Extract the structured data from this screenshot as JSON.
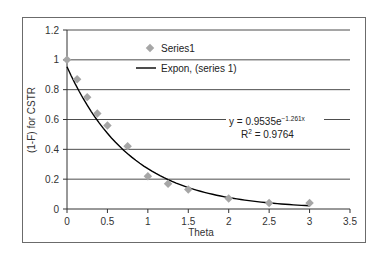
{
  "chart_data": {
    "type": "scatter",
    "title": "",
    "xlabel": "Theta",
    "ylabel": "(1-F) for CSTR",
    "xlim": [
      0,
      3.5
    ],
    "ylim": [
      0,
      1.2
    ],
    "x_ticks": [
      "0",
      "0.5",
      "1",
      "1.5",
      "2",
      "2.5",
      "3",
      "3.5"
    ],
    "y_ticks": [
      "0",
      "0.2",
      "0.4",
      "0.6",
      "0.8",
      "1",
      "1.2"
    ],
    "grid": {
      "horizontal": true,
      "vertical": false
    },
    "legend_position": "upper-center-inside",
    "series": [
      {
        "name": "Series1",
        "kind": "markers",
        "marker": "diamond",
        "color": "#a6a6a6",
        "x": [
          0,
          0.125,
          0.25,
          0.375,
          0.5,
          0.75,
          1.0,
          1.25,
          1.5,
          2.0,
          2.5,
          3.0
        ],
        "y": [
          1.0,
          0.87,
          0.75,
          0.64,
          0.56,
          0.42,
          0.22,
          0.17,
          0.13,
          0.07,
          0.04,
          0.04
        ]
      },
      {
        "name": "Expon, (series 1)",
        "kind": "trendline",
        "model": "exponential",
        "a": 0.9535,
        "b": -1.261,
        "x_range": [
          0,
          3
        ],
        "color": "#000000"
      }
    ],
    "annotations": [
      {
        "text": "y = 0.9535e",
        "superscript": "-1.261x"
      },
      {
        "text": "R",
        "superscript": "2",
        "suffix": " = 0.9764"
      }
    ]
  },
  "legend": {
    "series_label": "Series1",
    "trend_label": "Expon, (series 1)"
  },
  "equation": {
    "main": "y = 0.9535e",
    "exponent": "−1.261x",
    "r_prefix": "R",
    "r_sup": "2",
    "r_value": " = 0.9764"
  },
  "axes": {
    "x_title": "Theta",
    "y_title": "(1-F) for CSTR"
  },
  "colors": {
    "marker": "#a6a6a6",
    "trendline": "#000000",
    "grid": "#4d4d4d",
    "frame": "#555555"
  }
}
